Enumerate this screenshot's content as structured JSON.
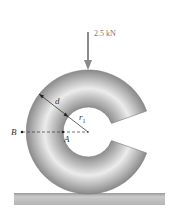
{
  "figure": {
    "load": {
      "value": "2.5 kN",
      "direction": "down"
    },
    "labels": {
      "d": "d",
      "r1_main": "r",
      "r1_sub": "1",
      "point_b": "B",
      "point_a": "A"
    },
    "colors": {
      "body_light": "#e8e8e8",
      "body_dark": "#8c8c8c",
      "ground": "#b8b8b8",
      "arrow": "#8a8a8a",
      "lines": "#333333"
    }
  }
}
